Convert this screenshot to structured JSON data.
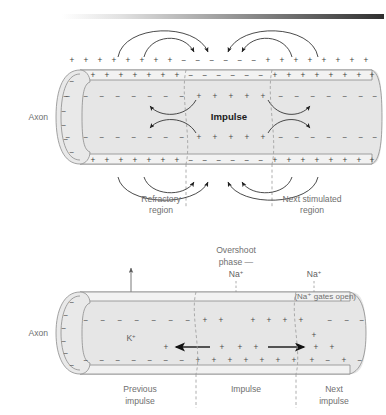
{
  "figure": {
    "background_color": "#ffffff",
    "axon_fill_color": "#e6e6e6",
    "membrane_color": "#8b8b8b",
    "label_color": "#6f6f6f",
    "arrow_color": "#2a2a2a"
  },
  "gradient_bar": {
    "name": "top-gradient-bar",
    "from_color": "#ffffff",
    "to_color": "#3a3a3a",
    "x": 62,
    "y": 14,
    "width": 322,
    "height": 5
  },
  "panel_top": {
    "axon_label": "Axon",
    "impulse_label": "Impulse",
    "captions": [
      {
        "line1": "Refractory",
        "line2": "region"
      },
      {
        "line1": "Next stimulated",
        "line2": "region"
      }
    ],
    "outer_charges_top": [
      "+",
      "+",
      "+",
      "+",
      "+",
      "+",
      "+",
      "+",
      "−",
      "−",
      "−",
      "−",
      "−",
      "−",
      "+",
      "+",
      "+",
      "+",
      "+",
      "+",
      "+",
      "+"
    ],
    "outer_charges_bottom": [
      "+",
      "+",
      "+",
      "+",
      "+",
      "+",
      "+",
      "+",
      "−",
      "−",
      "−",
      "−",
      "−",
      "−",
      "+",
      "+",
      "+",
      "+",
      "+",
      "+",
      "+",
      "+"
    ],
    "membrane_charges_top": [
      "+",
      "+",
      "+",
      "+",
      "+",
      "+",
      "+",
      "+",
      "−",
      "−",
      "−",
      "−",
      "−",
      "−",
      "+",
      "+",
      "+",
      "+",
      "+",
      "+",
      "+",
      "+"
    ],
    "membrane_charges_bottom": [
      "+",
      "+",
      "+",
      "+",
      "+",
      "+",
      "+",
      "+",
      "−",
      "−",
      "−",
      "−",
      "−",
      "−",
      "+",
      "+",
      "+",
      "+",
      "+",
      "+",
      "+",
      "+"
    ],
    "inner_charges_upper": [
      "−",
      "−",
      "−",
      "−",
      "−",
      "−",
      "−",
      "−",
      "+",
      "+",
      "+",
      "+",
      "+",
      "+",
      "−",
      "−",
      "−",
      "−",
      "−",
      "−",
      "−"
    ],
    "inner_charges_lower": [
      "−",
      "−",
      "−",
      "−",
      "−",
      "−",
      "−",
      "−",
      "+",
      "+",
      "+",
      "+",
      "+",
      "+",
      "−",
      "−",
      "−",
      "−",
      "−",
      "−",
      "−"
    ],
    "end_cap_charges": [
      "−",
      "−",
      "−",
      "−",
      "−",
      "−"
    ],
    "current_loops": "local circuit current arcs flowing from positive toward negative regions"
  },
  "panel_bottom": {
    "axon_label": "Axon",
    "overshoot_label_line1": "Overshoot",
    "overshoot_label_line2": "phase —",
    "overshoot_ion": "Na",
    "overshoot_ion_charge": "+",
    "right_ion": "Na",
    "right_ion_charge": "+",
    "gates_open_label": "(Na⁺ gates open)",
    "potassium_ion": "K",
    "potassium_ion_charge": "+",
    "captions": [
      {
        "line1": "Previous",
        "line2": "impulse"
      },
      {
        "line1": "Impulse",
        "line2": ""
      },
      {
        "line1": "Next",
        "line2": "impulse"
      }
    ],
    "inner_charges_upper": [
      "−",
      "−",
      "−",
      "−",
      "−",
      "−",
      "−",
      "−",
      "+",
      "+",
      "+",
      "+",
      "+",
      "+",
      "+",
      "−",
      "−",
      "−"
    ],
    "inner_charges_lower": [
      "−",
      "−",
      "−",
      "−",
      "−",
      "−",
      "−",
      "+",
      "+",
      "+",
      "+",
      "+",
      "+",
      "+",
      "+",
      "−",
      "+",
      "−",
      "−"
    ],
    "end_cap_charges": [
      "−",
      "−",
      "−",
      "−",
      "−",
      "−"
    ],
    "flow_arrows": [
      "left",
      "right"
    ]
  }
}
